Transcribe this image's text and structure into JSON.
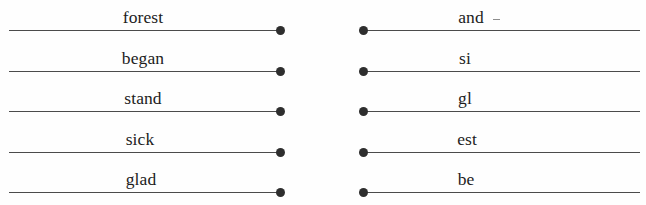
{
  "page": {
    "background_color": "#fefefe",
    "rule_color": "#4b4b4b",
    "dot_color": "#2e2e2e",
    "text_color": "#1c1c1c"
  },
  "columns": [
    {
      "name": "left-column",
      "dot_side": "right",
      "rows": [
        {
          "word": "forest",
          "word_center_x": 134,
          "line_y": 30,
          "dot": true
        },
        {
          "word": "began",
          "word_center_x": 134,
          "line_y": 71,
          "dot": true
        },
        {
          "word": "stand",
          "word_center_x": 134,
          "line_y": 111,
          "dot": true
        },
        {
          "word": "sick",
          "word_center_x": 131,
          "line_y": 152,
          "dot": true
        },
        {
          "word": "glad",
          "word_center_x": 132,
          "line_y": 192,
          "dot": true
        }
      ]
    },
    {
      "name": "right-column",
      "dot_side": "left",
      "rows": [
        {
          "word": "and",
          "word_center_x": 108,
          "line_y": 30,
          "dot": true,
          "tick": true
        },
        {
          "word": "si",
          "word_center_x": 102,
          "line_y": 71,
          "dot": true,
          "tick": false
        },
        {
          "word": "gl",
          "word_center_x": 102,
          "line_y": 111,
          "dot": true,
          "tick": false
        },
        {
          "word": "est",
          "word_center_x": 104,
          "line_y": 152,
          "dot": true,
          "tick": false
        },
        {
          "word": "be",
          "word_center_x": 103,
          "line_y": 192,
          "dot": true,
          "tick": false
        }
      ]
    }
  ]
}
